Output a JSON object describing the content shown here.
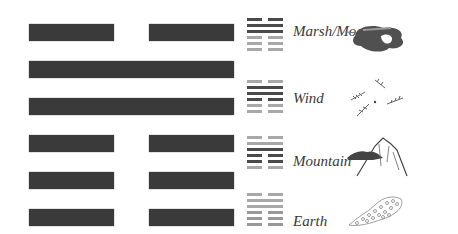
{
  "hexagram": {
    "lines": [
      {
        "type": "broken"
      },
      {
        "type": "solid"
      },
      {
        "type": "solid"
      },
      {
        "type": "broken"
      },
      {
        "type": "broken"
      },
      {
        "type": "broken"
      }
    ],
    "color": "#3a3a3a"
  },
  "trigram_rows": [
    {
      "label": "Marsh/Moon",
      "icon": "moon-cloud-icon",
      "lines": [
        [
          "broken",
          "dark"
        ],
        [
          "solid",
          "dark"
        ],
        [
          "solid",
          "dark"
        ],
        [
          "broken",
          "light"
        ],
        [
          "broken",
          "light"
        ],
        [
          "broken",
          "light"
        ]
      ]
    },
    {
      "label": "Wind",
      "icon": "wind-leaves-icon",
      "lines": [
        [
          "broken",
          "light"
        ],
        [
          "solid",
          "dark"
        ],
        [
          "solid",
          "dark"
        ],
        [
          "broken",
          "dark"
        ],
        [
          "broken",
          "light"
        ],
        [
          "broken",
          "light"
        ]
      ]
    },
    {
      "label": "Mountain",
      "icon": "mountain-icon",
      "lines": [
        [
          "broken",
          "light"
        ],
        [
          "solid",
          "light"
        ],
        [
          "solid",
          "dark"
        ],
        [
          "broken",
          "dark"
        ],
        [
          "broken",
          "dark"
        ],
        [
          "broken",
          "light"
        ]
      ]
    },
    {
      "label": "Earth",
      "icon": "earth-soil-icon",
      "lines": [
        [
          "broken",
          "light"
        ],
        [
          "solid",
          "light"
        ],
        [
          "solid",
          "light"
        ],
        [
          "broken",
          "light"
        ],
        [
          "broken",
          "light"
        ],
        [
          "broken",
          "light"
        ]
      ]
    }
  ],
  "colors": {
    "dark": "#4a4a4a",
    "light": "#a8a8a8"
  }
}
